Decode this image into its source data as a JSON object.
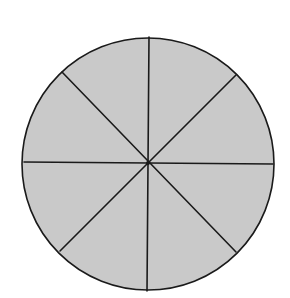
{
  "diagram": {
    "type": "circle-divided-into-equal-sectors",
    "sector_count": 8,
    "shaded_sectors": 8,
    "fill_color": "#c8c8c8",
    "stroke_color": "#1a1a1a",
    "background_color": "#ffffff",
    "center": [
      148,
      163
    ],
    "radius": 126
  }
}
